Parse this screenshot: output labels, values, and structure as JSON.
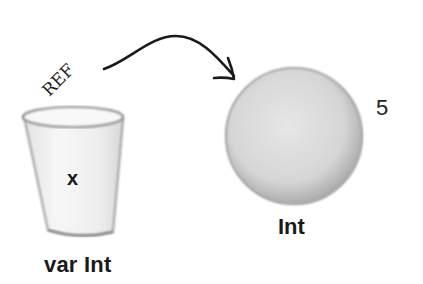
{
  "diagram": {
    "variable": {
      "name": "x",
      "declaration": "var Int",
      "container_icon": "cup-icon"
    },
    "reference": {
      "label": "REF",
      "arrow_icon": "curved-arrow-icon"
    },
    "object": {
      "type": "Int",
      "value": "5",
      "object_icon": "ball-icon"
    },
    "colors": {
      "ink": "#1a1a1a",
      "object_fill": "#d9d9d9",
      "cup_fill": "#f2f2f2"
    }
  }
}
